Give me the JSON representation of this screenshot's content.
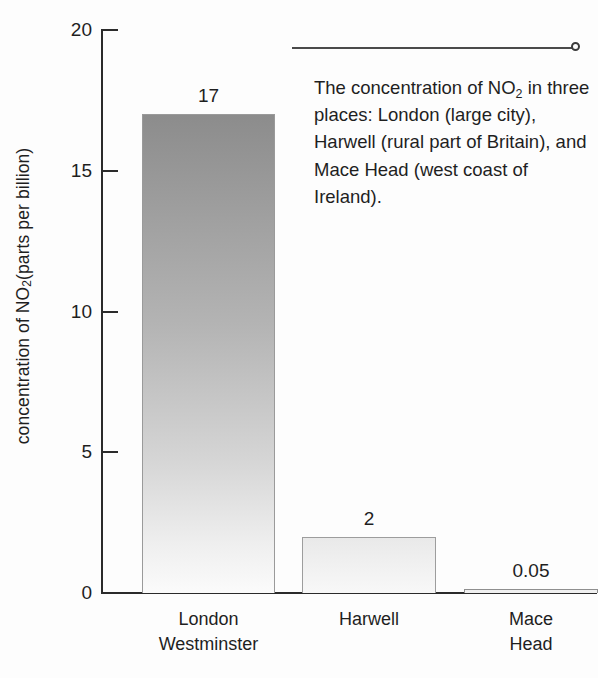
{
  "chart_data": {
    "type": "bar",
    "title": "",
    "subtitle": "",
    "xlabel": "",
    "ylabel": "concentration of NO2 (parts per billion)",
    "ylabel_parts": {
      "pre": "concentration of NO",
      "sub": "2",
      "post": " (parts per billion)"
    },
    "categories": [
      "London Westminster",
      "Harwell",
      "Mace Head"
    ],
    "category_labels": [
      "London\nWestminster",
      "Harwell",
      "Mace Head"
    ],
    "values": [
      17,
      2,
      0.05
    ],
    "value_labels": [
      "17",
      "2",
      "0.05"
    ],
    "ylim": [
      0,
      20
    ],
    "yticks": [
      0,
      5,
      10,
      15,
      20
    ],
    "ytick_labels": [
      "0",
      "5",
      "10",
      "15",
      "20"
    ],
    "grid": false,
    "legend": "none",
    "bar_colors": [
      "#a8a8a8",
      "#eeeeee",
      "#f0f0f0"
    ],
    "axis_color": "#2b2b2b",
    "background_color": "#fdfdfd"
  },
  "annotation": {
    "text_parts": {
      "pre": "The concentration of NO",
      "sub": "2",
      "post": " in three places: London (large city), Harwell (rural part of Britain), and Mace Head (west coast of Ireland)."
    },
    "full_text": "The concentration of NO2 in three places: London (large city), Harwell (rural part of Britain), and Mace Head (west coast of Ireland).",
    "leader_line": "horizontal-rule-with-end-dot"
  }
}
